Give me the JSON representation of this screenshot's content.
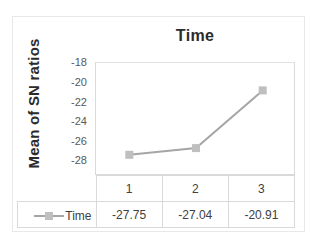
{
  "figure": {
    "top_text_sliver": "",
    "title": "Time",
    "y_axis_title": "Mean of SN ratios"
  },
  "colors": {
    "series": "#a6a6a6",
    "marker": "#bfbfbf",
    "grid": "#d9d9d9",
    "text": "#404040",
    "title_text": "#2b2b2b",
    "frame": "#e8e8ea",
    "background": "#ffffff"
  },
  "chart_data": {
    "type": "line",
    "title": "Time",
    "xlabel": "",
    "ylabel": "Mean of SN ratios",
    "categories": [
      "1",
      "2",
      "3"
    ],
    "series": [
      {
        "name": "Time",
        "values": [
          -27.75,
          -27.04,
          -20.91
        ]
      }
    ],
    "ylim": [
      -30,
      -18
    ],
    "yticks": [
      "-18",
      "-20",
      "-22",
      "-24",
      "-26",
      "-28",
      "-30"
    ],
    "ytick_values": [
      -18,
      -20,
      -22,
      -24,
      -26,
      -28,
      -30
    ],
    "grid": false,
    "legend_position": "data-table-row",
    "marker": "square",
    "data_table": {
      "series_label": "Time",
      "columns": [
        "1",
        "2",
        "3"
      ],
      "values": [
        "-27.75",
        "-27.04",
        "-20.91"
      ]
    }
  }
}
